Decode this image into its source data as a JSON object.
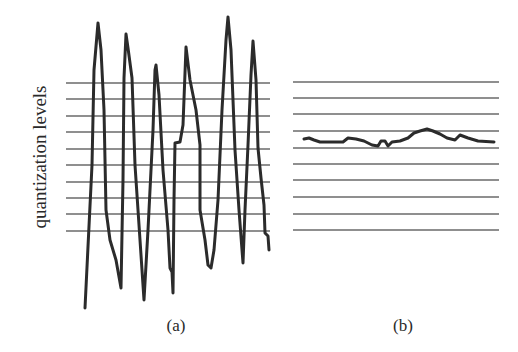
{
  "figure": {
    "ylabel": "quantization levels",
    "panels": [
      {
        "id": "a",
        "label": "(a)"
      },
      {
        "id": "b",
        "label": "(b)"
      }
    ]
  },
  "chart_data": [
    {
      "type": "line",
      "title": "(a)",
      "ylabel": "quantization levels",
      "xlabel": "",
      "grid": "horizontal",
      "quantization_levels_y_px": [
        83,
        99,
        116,
        132,
        149,
        165,
        182,
        198,
        214,
        231
      ],
      "level_count": 10,
      "description": "Large-amplitude oscillating signal spanning far beyond all quantization levels",
      "series": [
        {
          "name": "signal",
          "points": [
            [
              85,
              308
            ],
            [
              92,
              165
            ],
            [
              94,
              70
            ],
            [
              98,
              23
            ],
            [
              101,
              50
            ],
            [
              104,
              110
            ],
            [
              106,
              210
            ],
            [
              110,
              240
            ],
            [
              116,
              260
            ],
            [
              121,
              288
            ],
            [
              123,
              180
            ],
            [
              124,
              78
            ],
            [
              126,
              34
            ],
            [
              128,
              48
            ],
            [
              132,
              78
            ],
            [
              135,
              165
            ],
            [
              140,
              240
            ],
            [
              144,
              300
            ],
            [
              148,
              230
            ],
            [
              153,
              130
            ],
            [
              155,
              70
            ],
            [
              156,
              65
            ],
            [
              159,
              95
            ],
            [
              163,
              170
            ],
            [
              168,
              230
            ],
            [
              170,
              268
            ],
            [
              172,
              272
            ],
            [
              173,
              293
            ],
            [
              174,
              200
            ],
            [
              175,
              143
            ],
            [
              180,
              142
            ],
            [
              183,
              125
            ],
            [
              186,
              47
            ],
            [
              190,
              80
            ],
            [
              196,
              110
            ],
            [
              200,
              145
            ],
            [
              200,
              210
            ],
            [
              205,
              240
            ],
            [
              208,
              265
            ],
            [
              211,
              268
            ],
            [
              214,
              250
            ],
            [
              218,
              200
            ],
            [
              222,
              110
            ],
            [
              226,
              40
            ],
            [
              228,
              17
            ],
            [
              231,
              50
            ],
            [
              235,
              150
            ],
            [
              239,
              210
            ],
            [
              243,
              263
            ],
            [
              245,
              210
            ],
            [
              248,
              145
            ],
            [
              251,
              75
            ],
            [
              253,
              41
            ],
            [
              256,
              80
            ],
            [
              258,
              148
            ],
            [
              261,
              178
            ],
            [
              264,
              205
            ],
            [
              265,
              233
            ],
            [
              268,
              236
            ],
            [
              269,
              250
            ]
          ]
        }
      ],
      "grid_x_range_px": [
        66,
        270
      ]
    },
    {
      "type": "line",
      "title": "(b)",
      "xlabel": "",
      "grid": "horizontal",
      "quantization_levels_y_px": [
        82,
        98,
        114,
        131,
        148,
        164,
        180,
        197,
        214,
        230
      ],
      "level_count": 10,
      "description": "Small-amplitude signal confined between two adjacent quantization levels",
      "series": [
        {
          "name": "signal",
          "points": [
            [
              304,
              139
            ],
            [
              309,
              138
            ],
            [
              314,
              140
            ],
            [
              320,
              142
            ],
            [
              330,
              142
            ],
            [
              343,
              142
            ],
            [
              348,
              138
            ],
            [
              356,
              139
            ],
            [
              364,
              141
            ],
            [
              372,
              145
            ],
            [
              378,
              146
            ],
            [
              381,
              141
            ],
            [
              385,
              141
            ],
            [
              388,
              146
            ],
            [
              392,
              142
            ],
            [
              400,
              141
            ],
            [
              408,
              138
            ],
            [
              414,
              133
            ],
            [
              420,
              131
            ],
            [
              427,
              129
            ],
            [
              433,
              131
            ],
            [
              440,
              134
            ],
            [
              447,
              138
            ],
            [
              455,
              140
            ],
            [
              460,
              135
            ],
            [
              468,
              138
            ],
            [
              478,
              141
            ],
            [
              494,
              142
            ]
          ]
        }
      ],
      "grid_x_range_px": [
        293,
        499
      ]
    }
  ]
}
